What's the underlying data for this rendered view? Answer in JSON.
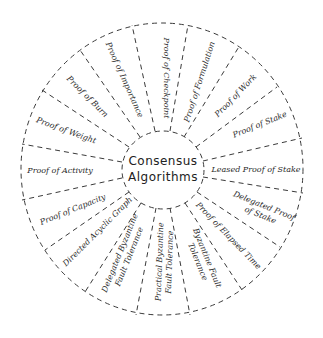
{
  "diagram": {
    "type": "radial-wheel",
    "center": {
      "line1": "Consensus",
      "line2": "Algorithms"
    },
    "sectors": [
      {
        "id": "checkpoint",
        "lines": [
          "Proof of Checkpoint"
        ]
      },
      {
        "id": "formulation",
        "lines": [
          "Proof of Formulation"
        ]
      },
      {
        "id": "work",
        "lines": [
          "Proof of Work"
        ]
      },
      {
        "id": "stake",
        "lines": [
          "Proof of Stake"
        ]
      },
      {
        "id": "leased-pos",
        "lines": [
          "Leased Proof of Stake"
        ]
      },
      {
        "id": "delegated-pos",
        "lines": [
          "Delegated Proof",
          "of Stake"
        ]
      },
      {
        "id": "elapsed-time",
        "lines": [
          "Proof of Elapsed Time"
        ]
      },
      {
        "id": "bft",
        "lines": [
          "Byzantine Fault",
          "Tolerance"
        ]
      },
      {
        "id": "pbft",
        "lines": [
          "Practical Byzantine",
          "Fault Tolerance"
        ]
      },
      {
        "id": "dbft",
        "lines": [
          "Delegated Byzantine",
          "Fault Tolerance"
        ]
      },
      {
        "id": "dag",
        "lines": [
          "Directed Acyclic Graph"
        ]
      },
      {
        "id": "capacity",
        "lines": [
          "Proof of Capacity"
        ]
      },
      {
        "id": "activity",
        "lines": [
          "Proof of Activity"
        ]
      },
      {
        "id": "weight",
        "lines": [
          "Proof of Weight"
        ]
      },
      {
        "id": "burn",
        "lines": [
          "Proof of Burn"
        ]
      },
      {
        "id": "importance",
        "lines": [
          "Proof of Importance"
        ]
      }
    ]
  }
}
